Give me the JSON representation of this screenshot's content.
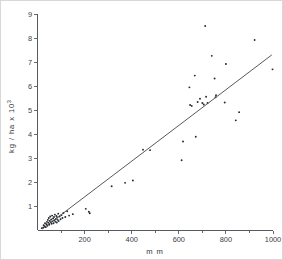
{
  "chart_data": {
    "type": "scatter",
    "title": "",
    "xlabel": "m m",
    "ylabel": "kg / ha  x 10",
    "ylabel_exponent": "3",
    "xlim": [
      0,
      1000
    ],
    "ylim": [
      0,
      9
    ],
    "grid": false,
    "legend": null,
    "x_ticks_major": [
      200,
      400,
      600,
      800,
      1000
    ],
    "x_ticks_minor": [
      100,
      300,
      500,
      700,
      900
    ],
    "x_tick_labels": [
      "200",
      "400",
      "600",
      "800",
      "1000"
    ],
    "y_ticks_major": [
      1,
      2,
      3,
      4,
      5,
      6,
      7,
      8,
      9
    ],
    "y_tick_labels": [
      "1",
      "2",
      "3",
      "4",
      "5",
      "6",
      "7",
      "8",
      "9"
    ],
    "points": [
      [
        18,
        0.1
      ],
      [
        24,
        0.12
      ],
      [
        26,
        0.22
      ],
      [
        30,
        0.18
      ],
      [
        32,
        0.3
      ],
      [
        35,
        0.14
      ],
      [
        38,
        0.26
      ],
      [
        40,
        0.36
      ],
      [
        42,
        0.2
      ],
      [
        44,
        0.44
      ],
      [
        46,
        0.32
      ],
      [
        48,
        0.52
      ],
      [
        50,
        0.24
      ],
      [
        52,
        0.4
      ],
      [
        54,
        0.58
      ],
      [
        56,
        0.34
      ],
      [
        58,
        0.46
      ],
      [
        60,
        0.28
      ],
      [
        62,
        0.62
      ],
      [
        64,
        0.38
      ],
      [
        66,
        0.5
      ],
      [
        68,
        0.3
      ],
      [
        70,
        0.56
      ],
      [
        72,
        0.42
      ],
      [
        74,
        0.66
      ],
      [
        76,
        0.36
      ],
      [
        78,
        0.48
      ],
      [
        80,
        0.6
      ],
      [
        82,
        0.33
      ],
      [
        84,
        0.54
      ],
      [
        86,
        0.44
      ],
      [
        88,
        0.7
      ],
      [
        90,
        0.39
      ],
      [
        94,
        0.58
      ],
      [
        98,
        0.47
      ],
      [
        102,
        0.64
      ],
      [
        106,
        0.52
      ],
      [
        110,
        0.73
      ],
      [
        118,
        0.56
      ],
      [
        126,
        0.8
      ],
      [
        134,
        0.62
      ],
      [
        150,
        0.68
      ],
      [
        205,
        0.9
      ],
      [
        218,
        0.78
      ],
      [
        222,
        0.72
      ],
      [
        315,
        1.84
      ],
      [
        372,
        1.98
      ],
      [
        405,
        2.08
      ],
      [
        448,
        3.36
      ],
      [
        478,
        3.34
      ],
      [
        612,
        2.92
      ],
      [
        618,
        3.7
      ],
      [
        645,
        5.95
      ],
      [
        648,
        5.22
      ],
      [
        655,
        5.18
      ],
      [
        668,
        6.44
      ],
      [
        672,
        3.9
      ],
      [
        680,
        5.34
      ],
      [
        690,
        5.48
      ],
      [
        700,
        5.3
      ],
      [
        706,
        5.24
      ],
      [
        712,
        8.5
      ],
      [
        716,
        5.56
      ],
      [
        722,
        5.3
      ],
      [
        740,
        7.26
      ],
      [
        752,
        6.32
      ],
      [
        756,
        5.54
      ],
      [
        758,
        5.62
      ],
      [
        795,
        5.32
      ],
      [
        800,
        6.92
      ],
      [
        842,
        4.58
      ],
      [
        856,
        4.92
      ],
      [
        922,
        7.92
      ],
      [
        998,
        6.7
      ]
    ],
    "fit_line": {
      "x_start": 20,
      "y_start": 0.06,
      "x_end": 995,
      "y_end": 7.3,
      "label": "regression line"
    }
  }
}
